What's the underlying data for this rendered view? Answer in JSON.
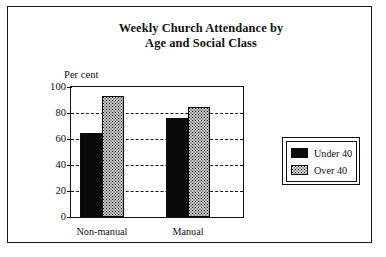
{
  "chart_data": {
    "type": "bar",
    "title": "Weekly Church Attendance by Age and Social Class",
    "title_line1": "Weekly Church Attendance by",
    "title_line2": "Age and Social Class",
    "xlabel": "",
    "ylabel": "Per cent",
    "categories": [
      "Non-manual",
      "Manual"
    ],
    "series": [
      {
        "name": "Under 40",
        "values": [
          65,
          76
        ],
        "fill": "solid-black",
        "color": "#0a0a0a"
      },
      {
        "name": "Over 40",
        "values": [
          93,
          85
        ],
        "fill": "dotted-stipple",
        "color": "#c9c9c9"
      }
    ],
    "ylim": [
      0,
      100
    ],
    "yticks": [
      0,
      20,
      40,
      60,
      80,
      100
    ],
    "ytick_labels": [
      "0",
      "20",
      "40",
      "60",
      "80",
      "100"
    ],
    "grid": "horizontal-dashed",
    "legend_position": "right-outside",
    "frame": true
  },
  "legend": {
    "items": [
      {
        "label": "Under 40"
      },
      {
        "label": "Over 40"
      }
    ]
  }
}
